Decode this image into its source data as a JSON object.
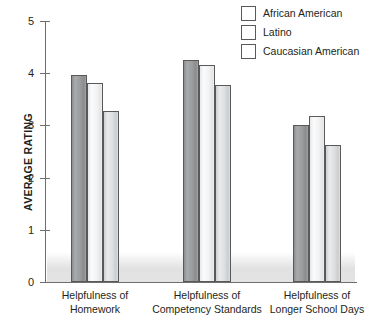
{
  "chart_data": {
    "type": "bar",
    "title": "",
    "subtitle": "",
    "xlabel": "",
    "ylabel": "AVERAGE RATING",
    "ylim": [
      0,
      5
    ],
    "ytick_labels": [
      "5",
      "4",
      "3",
      "2",
      "1",
      "0"
    ],
    "ytick_values": [
      5,
      4,
      3,
      2,
      1,
      0
    ],
    "grid": false,
    "legend_position": "top-right",
    "categories": [
      "Helpfulness of Homework",
      "Helpfulness of Competency Standards",
      "Helpfulness of Longer School Days"
    ],
    "category_lines": [
      [
        "Helpfulness of",
        "Homework"
      ],
      [
        "Helpfulness of",
        "Competency Standards"
      ],
      [
        "Helpfulness of",
        "Longer School Days"
      ]
    ],
    "series": [
      {
        "name": "African American",
        "color": "#9a9b9d",
        "values": [
          3.96,
          4.26,
          3.0
        ]
      },
      {
        "name": "Latino",
        "color": "#f2f2f3",
        "values": [
          3.82,
          4.15,
          3.18
        ]
      },
      {
        "name": "Caucasian American",
        "color": "#dddee0",
        "values": [
          3.28,
          3.78,
          2.63
        ]
      }
    ]
  },
  "legend": {
    "items": [
      {
        "label": "African American"
      },
      {
        "label": "Latino"
      },
      {
        "label": "Caucasian American"
      }
    ]
  },
  "axes": {
    "y_title": "AVERAGE RATING"
  }
}
